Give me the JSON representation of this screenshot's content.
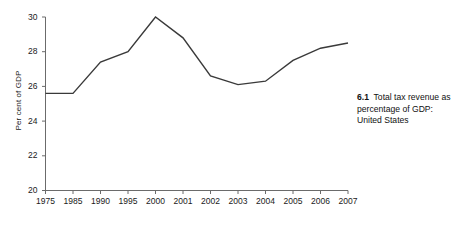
{
  "figure": {
    "caption_number": "6.1",
    "caption_text": "Total tax revenue as percentage of GDP: United States"
  },
  "chart_data": {
    "type": "line",
    "title": "",
    "xlabel": "",
    "ylabel": "Per cent of GDP",
    "categories": [
      "1975",
      "1985",
      "1990",
      "1995",
      "2000",
      "2001",
      "2002",
      "2003",
      "2004",
      "2005",
      "2006",
      "2007"
    ],
    "values": [
      25.6,
      25.6,
      27.4,
      28.0,
      30.0,
      28.8,
      26.6,
      26.1,
      26.3,
      27.5,
      28.2,
      28.5
    ],
    "ylim": [
      20,
      30
    ],
    "yticks": [
      "20",
      "22",
      "24",
      "26",
      "28",
      "30"
    ],
    "ytick_values": [
      20,
      22,
      24,
      26,
      28,
      30
    ],
    "grid": false,
    "legend": "none",
    "line_color": "#3a3a3a",
    "axis_color": "#6b6b6b"
  }
}
